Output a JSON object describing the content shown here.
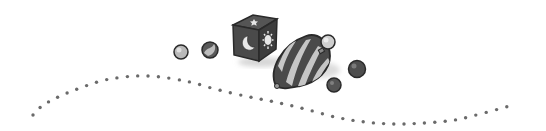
{
  "illustration": {
    "title": "Decorative toys illustration",
    "description": "Grayscale clip-art of a toy block with moon, star and sun symbols, a striped spinning top and several marbles above a wavy dotted line",
    "style": "grayscale",
    "colors": {
      "outline": "#2a2a2a",
      "dark_fill": "#4a4a4a",
      "mid_fill": "#7a7a7a",
      "light_fill": "#c4c4c4",
      "dots": "#6a6a6a",
      "background": "#ffffff"
    },
    "elements": {
      "block": {
        "symbols": [
          "star-icon",
          "moon-icon",
          "sun-icon"
        ]
      },
      "top": {
        "pattern": "diagonal stripes"
      },
      "marbles": 5,
      "dotted_path": "wavy"
    }
  }
}
